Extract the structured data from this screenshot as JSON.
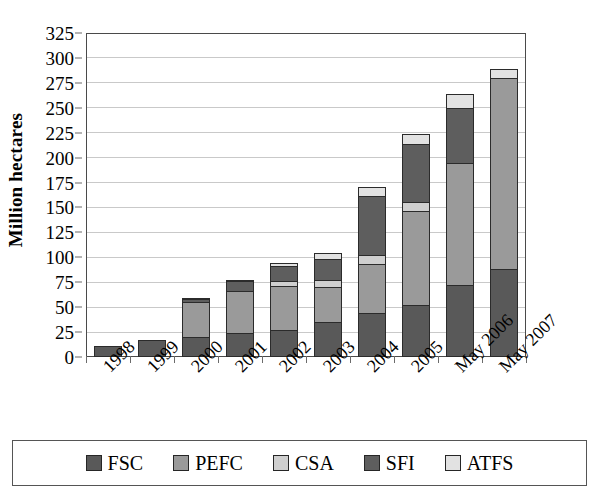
{
  "chart_data": {
    "type": "bar",
    "stacked": true,
    "title": "",
    "xlabel": "",
    "ylabel": "Million hectares",
    "ylim": [
      0,
      325
    ],
    "ytick_step": 25,
    "yticks": [
      0,
      25,
      50,
      75,
      100,
      125,
      150,
      175,
      200,
      225,
      250,
      275,
      300,
      325
    ],
    "grid": true,
    "legend_position": "bottom",
    "categories": [
      "1998",
      "1999",
      "2000",
      "2001",
      "2002",
      "2003",
      "2004",
      "2005",
      "May 2006",
      "May 2007"
    ],
    "series": [
      {
        "name": "FSC",
        "color": "#595959",
        "values": [
          11,
          17,
          20,
          24,
          27,
          35,
          44,
          52,
          72,
          88
        ]
      },
      {
        "name": "PEFC",
        "color": "#9a9a9a",
        "values": [
          0,
          0,
          36,
          44,
          46,
          37,
          51,
          96,
          124,
          193
        ]
      },
      {
        "name": "CSA",
        "color": "#cfcfcf",
        "values": [
          0,
          0,
          0,
          0,
          6,
          8,
          10,
          10,
          0,
          0
        ]
      },
      {
        "name": "SFI",
        "color": "#5e5e5e",
        "values": [
          0,
          0,
          5,
          11,
          16,
          22,
          60,
          60,
          56,
          0
        ]
      },
      {
        "name": "ATFS",
        "color": "#e2e2e2",
        "values": [
          0,
          0,
          1,
          2,
          5,
          8,
          11,
          11,
          16,
          11
        ]
      }
    ],
    "totals": [
      11,
      17,
      62,
      81,
      100,
      110,
      176,
      229,
      268,
      292
    ],
    "legend_entries": [
      "FSC",
      "PEFC",
      "CSA",
      "SFI",
      "ATFS"
    ]
  },
  "colors": {
    "fsc": "#595959",
    "pefc": "#9a9a9a",
    "csa": "#cfcfcf",
    "sfi": "#5e5e5e",
    "atfs": "#e2e2e2",
    "axis": "#4a4a4a",
    "grid": "#c9c9c9",
    "background": "#ffffff"
  }
}
